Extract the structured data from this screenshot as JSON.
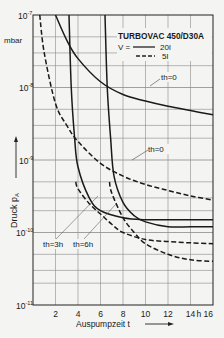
{
  "chart_data": {
    "type": "line",
    "title": "TURBOVAC 450/D30A",
    "xlabel": "Auspumpzeit t",
    "ylabel": "Druck pA",
    "y_unit": "mbar",
    "x_unit": "h",
    "xscale": "linear",
    "yscale": "log",
    "xlim": [
      0,
      16
    ],
    "ylim": [
      1e-11,
      1e-07
    ],
    "grid": true,
    "x_ticks": [
      2,
      4,
      6,
      8,
      10,
      12,
      14,
      16
    ],
    "x_tick_labels": [
      "2",
      "4",
      "6",
      "8",
      "10",
      "12",
      "14",
      "h 16"
    ],
    "y_ticks": [
      "10^-7",
      "10^-8",
      "10^-9",
      "10^-10",
      "10^-11"
    ],
    "legend": {
      "prefix": "V =",
      "entries": [
        {
          "style": "solid",
          "label": "20 l"
        },
        {
          "style": "dashed",
          "label": "5 l"
        }
      ],
      "position": "top-right"
    },
    "annotations": [
      "th=0",
      "th=0",
      "th=3h",
      "th=6h"
    ],
    "series": [
      {
        "name": "V=20l, th=0",
        "style": "solid",
        "x": [
          2.0,
          3,
          4,
          6,
          8,
          10,
          12,
          14,
          16
        ],
        "y": [
          1e-07,
          4.5e-08,
          2.5e-08,
          1.2e-08,
          8e-09,
          6.5e-09,
          5.5e-09,
          4.8e-09,
          4.2e-09
        ]
      },
      {
        "name": "V=5l, th=0",
        "style": "dashed",
        "x": [
          0.6,
          1,
          2,
          3,
          4,
          6,
          8,
          10,
          12,
          14,
          16
        ],
        "y": [
          1e-07,
          3e-08,
          6e-09,
          3e-09,
          1.8e-09,
          9e-10,
          6e-10,
          4.6e-10,
          3.8e-10,
          3.2e-10,
          2.8e-10
        ]
      },
      {
        "name": "V=20l, th=3h",
        "style": "solid",
        "x": [
          3.2,
          3.4,
          3.7,
          4,
          5,
          6,
          8,
          10,
          12,
          14,
          16
        ],
        "y": [
          1e-07,
          1e-08,
          2e-09,
          8e-10,
          3e-10,
          2e-10,
          1.6e-10,
          1.5e-10,
          1.5e-10,
          1.5e-10,
          1.5e-10
        ]
      },
      {
        "name": "V=20l, th=6h",
        "style": "solid",
        "x": [
          6.4,
          6.6,
          6.9,
          7.2,
          8,
          9,
          10,
          12,
          14,
          16
        ],
        "y": [
          1e-07,
          1e-08,
          2e-09,
          6e-10,
          2.6e-10,
          1.7e-10,
          1.4e-10,
          1.2e-10,
          1.2e-10,
          1.2e-10
        ]
      },
      {
        "name": "V=5l, th=3h",
        "style": "dashed",
        "x": [
          3.8,
          4,
          5,
          6,
          7,
          8,
          10,
          12,
          14,
          16
        ],
        "y": [
          5e-10,
          4e-10,
          2.5e-10,
          1.8e-10,
          1.3e-10,
          1e-10,
          8e-11,
          7.5e-11,
          7.2e-11,
          7e-11
        ]
      },
      {
        "name": "V=5l, th=6h",
        "style": "dashed",
        "x": [
          6.8,
          7,
          8,
          9,
          10,
          12,
          14,
          16
        ],
        "y": [
          5e-10,
          3.5e-10,
          1.6e-10,
          1e-10,
          7e-11,
          5e-11,
          4.2e-11,
          4e-11
        ]
      }
    ]
  },
  "labels": {
    "y_unit": "mbar",
    "y_exp": [
      "-7",
      "-8",
      "-9",
      "-10",
      "-11"
    ],
    "y_base": "10",
    "ylabel": "Druck p",
    "ylabel_sub": "A",
    "xlabel": "Auspumpzeit t",
    "x_ticks": [
      "2",
      "4",
      "6",
      "8",
      "10",
      "12",
      "14",
      "h 16"
    ],
    "title": "TURBOVAC 450/D30A",
    "legend_prefix": "V =",
    "legend_solid": "20l",
    "legend_dashed": "5l",
    "ann_th0_solid": "th=0",
    "ann_th0_dashed": "th=0",
    "ann_th3": "th=3h",
    "ann_th6": "th=6h"
  }
}
